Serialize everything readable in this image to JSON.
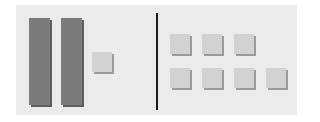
{
  "diagram": {
    "type": "base-ten-blocks",
    "left_group": {
      "tens_rods": 2,
      "units": 1
    },
    "right_group": {
      "units_row1": 3,
      "units_row2": 4
    },
    "colors": {
      "panel": "#ebebeb",
      "rod": "#7b7b7b",
      "unit": "#d2d2d2",
      "divider": "#1a1a1a"
    }
  }
}
